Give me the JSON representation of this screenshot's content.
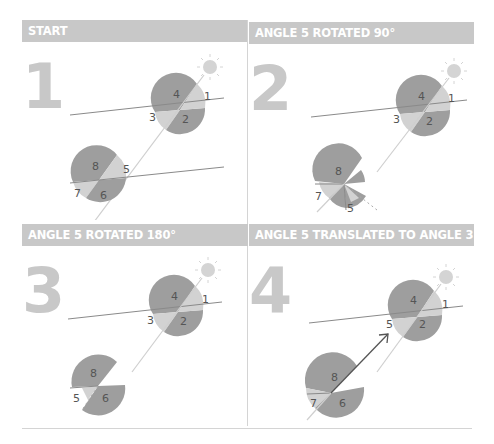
{
  "colors": {
    "header_bg": "#c8c8c8",
    "header_text": "#ffffff",
    "dark_wedge": "#9e9e9e",
    "light_wedge": "#d2d2d2",
    "sun": "#d4d4d4",
    "parallel_line": "#8a8a8a",
    "transversal": "#cfcfcf",
    "arrow": "#555555"
  },
  "panels": [
    {
      "step": "1",
      "title": "START",
      "labels": {
        "top": [
          "4",
          "1",
          "3",
          "2"
        ],
        "bottom": [
          "8",
          "5",
          "7",
          "6"
        ]
      }
    },
    {
      "step": "2",
      "title": "ANGLE 5 ROTATED 90°",
      "labels": {
        "top": [
          "4",
          "1",
          "3",
          "2"
        ],
        "bottom": [
          "8",
          "7",
          "5"
        ]
      }
    },
    {
      "step": "3",
      "title": "ANGLE 5 ROTATED 180°",
      "labels": {
        "top": [
          "4",
          "1",
          "3",
          "2"
        ],
        "bottom": [
          "8",
          "5",
          "6"
        ]
      }
    },
    {
      "step": "4",
      "title": "ANGLE 5 TRANSLATED TO ANGLE 3",
      "labels": {
        "top": [
          "4",
          "1",
          "5",
          "2"
        ],
        "bottom": [
          "8",
          "7",
          "6"
        ]
      }
    }
  ]
}
